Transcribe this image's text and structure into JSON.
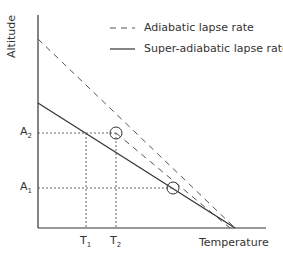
{
  "diagram": {
    "type": "line",
    "xlabel": "Temperature",
    "ylabel": "Altitude",
    "legend": [
      {
        "label": "Adiabatic lapse rate",
        "style": "dashed"
      },
      {
        "label": "Super-adiabatic lapse rate",
        "style": "solid"
      }
    ],
    "y_markers": [
      {
        "base": "A",
        "sub": "2"
      },
      {
        "base": "A",
        "sub": "1"
      }
    ],
    "x_markers": [
      {
        "base": "T",
        "sub": "1"
      },
      {
        "base": "T",
        "sub": "2"
      }
    ],
    "line_color": "#333333",
    "dashed_color": "#555555"
  }
}
